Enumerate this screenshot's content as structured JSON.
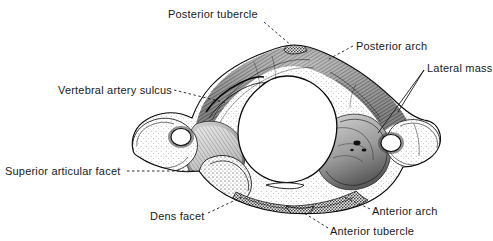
{
  "figure": {
    "view": "superior",
    "style": "stippled engraving, grayscale",
    "background_color": "#ffffff",
    "ink_color": "#1a1a1a",
    "width": 493,
    "height": 241
  },
  "labels": [
    {
      "id": "posterior-tubercle",
      "text": "Posterior tubercle",
      "x": 168,
      "y": 8,
      "align": "left",
      "leader": "dashed"
    },
    {
      "id": "posterior-arch",
      "text": "Posterior arch",
      "x": 356,
      "y": 40,
      "align": "left",
      "leader": "dashed"
    },
    {
      "id": "lateral-mass",
      "text": "Lateral mass",
      "x": 427,
      "y": 62,
      "align": "left",
      "leader": "solid"
    },
    {
      "id": "vertebral-artery-sulcus",
      "text": "Vertebral artery sulcus",
      "x": 58,
      "y": 84,
      "align": "left",
      "leader": "dashed"
    },
    {
      "id": "superior-articular-facet",
      "text": "Superior articular facet",
      "x": 5,
      "y": 165,
      "align": "left",
      "leader": "dashed"
    },
    {
      "id": "dens-facet",
      "text": "Dens facet",
      "x": 150,
      "y": 210,
      "align": "left",
      "leader": "dashed"
    },
    {
      "id": "anterior-arch",
      "text": "Anterior arch",
      "x": 372,
      "y": 205,
      "align": "left",
      "leader": "dashed"
    },
    {
      "id": "anterior-tubercle",
      "text": "Anterior tubercle",
      "x": 330,
      "y": 225,
      "align": "left",
      "leader": "dashed"
    }
  ],
  "anatomy": {
    "vertebral_foramen": {
      "cx": 287,
      "cy": 128,
      "rx": 45,
      "ry": 52
    },
    "left_transverse_foramen": {
      "cx": 181,
      "cy": 137,
      "rx": 10,
      "ry": 8
    },
    "right_transverse_foramen": {
      "cx": 391,
      "cy": 143,
      "rx": 10,
      "ry": 8
    },
    "posterior_tubercle": {
      "cx": 294,
      "cy": 49
    },
    "anterior_tubercle": {
      "cx": 299,
      "cy": 208
    },
    "bone_extent": {
      "left": 133,
      "right": 440,
      "top": 44,
      "bottom": 214
    }
  }
}
